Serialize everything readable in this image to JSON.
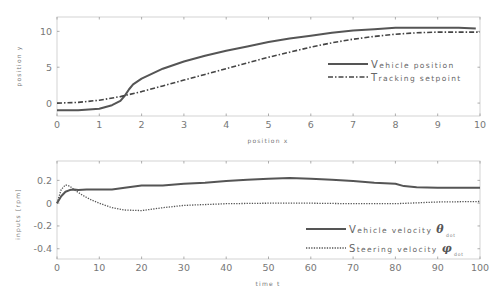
{
  "chart_data": [
    {
      "type": "line",
      "title": "",
      "xlabel": "position x",
      "ylabel": "position y",
      "xlim": [
        0,
        10
      ],
      "ylim": [
        -1.8,
        12
      ],
      "xticks": [
        0,
        1,
        2,
        3,
        4,
        5,
        6,
        7,
        8,
        9,
        10
      ],
      "yticks": [
        0,
        5,
        10
      ],
      "grid": false,
      "legend_position": "center right",
      "series": [
        {
          "name": "Vehicle position",
          "style": "solid",
          "color": "#555555",
          "x": [
            0,
            0.5,
            1.0,
            1.3,
            1.5,
            1.6,
            1.7,
            1.8,
            2.0,
            2.5,
            3.0,
            3.5,
            4.0,
            4.5,
            5.0,
            5.5,
            6.0,
            6.5,
            7.0,
            7.5,
            8.0,
            8.5,
            9.0,
            9.5,
            9.9
          ],
          "y": [
            -1.0,
            -1.0,
            -0.8,
            -0.3,
            0.3,
            1.0,
            1.9,
            2.6,
            3.4,
            4.8,
            5.8,
            6.6,
            7.3,
            7.9,
            8.5,
            9.0,
            9.4,
            9.8,
            10.1,
            10.3,
            10.5,
            10.5,
            10.5,
            10.5,
            10.4
          ]
        },
        {
          "name": "Tracking setpoint",
          "style": "dashdot",
          "color": "#444444",
          "x": [
            0,
            0.5,
            1.0,
            1.5,
            2.0,
            2.5,
            3.0,
            3.5,
            4.0,
            4.5,
            5.0,
            5.5,
            6.0,
            6.5,
            7.0,
            7.5,
            8.0,
            8.5,
            9.0,
            9.5,
            10.0
          ],
          "y": [
            0.0,
            0.1,
            0.4,
            0.9,
            1.6,
            2.4,
            3.2,
            4.0,
            4.8,
            5.6,
            6.4,
            7.1,
            7.8,
            8.4,
            8.9,
            9.3,
            9.6,
            9.8,
            9.9,
            9.9,
            9.9
          ]
        }
      ]
    },
    {
      "type": "line",
      "title": "",
      "xlabel": "time t",
      "ylabel": "inputs [rpm]",
      "xlim": [
        0,
        100
      ],
      "ylim": [
        -0.49,
        0.37
      ],
      "xticks": [
        0,
        10,
        20,
        30,
        40,
        50,
        60,
        70,
        80,
        90,
        100
      ],
      "yticks": [
        0.2,
        0,
        -0.2,
        -0.4
      ],
      "grid": false,
      "legend_position": "lower right",
      "series": [
        {
          "name": "Vehicle velocity θ_dot",
          "style": "solid",
          "color": "#555555",
          "x": [
            0,
            1,
            2,
            3,
            4,
            5,
            7,
            10,
            13,
            16,
            20,
            25,
            30,
            35,
            40,
            45,
            50,
            55,
            60,
            65,
            70,
            75,
            80,
            82,
            85,
            90,
            95,
            100
          ],
          "y": [
            0,
            0.06,
            0.1,
            0.115,
            0.12,
            0.115,
            0.12,
            0.12,
            0.12,
            0.135,
            0.155,
            0.155,
            0.17,
            0.18,
            0.195,
            0.205,
            0.215,
            0.22,
            0.215,
            0.205,
            0.195,
            0.18,
            0.17,
            0.15,
            0.14,
            0.135,
            0.135,
            0.135
          ]
        },
        {
          "name": "Steering velocity φ_dot",
          "style": "dotted",
          "color": "#555555",
          "x": [
            0,
            1,
            2,
            3,
            4,
            6,
            8,
            10,
            13,
            16,
            20,
            25,
            30,
            40,
            50,
            60,
            70,
            80,
            90,
            100
          ],
          "y": [
            0,
            0.12,
            0.16,
            0.15,
            0.12,
            0.07,
            0.03,
            0.0,
            -0.04,
            -0.06,
            -0.065,
            -0.04,
            -0.02,
            -0.005,
            0.0,
            0.0,
            -0.005,
            -0.005,
            0.01,
            0.015
          ]
        }
      ]
    }
  ],
  "top_plot": {
    "xlabel": "position x",
    "ylabel": "position y",
    "xtick_labels": [
      "0",
      "1",
      "2",
      "3",
      "4",
      "5",
      "6",
      "7",
      "8",
      "9",
      "10"
    ],
    "ytick_labels": [
      "0",
      "5",
      "10"
    ],
    "legend": {
      "item1_cap": "V",
      "item1_rest": "ehicle position",
      "item2_cap": "T",
      "item2_rest": "racking setpoint"
    }
  },
  "bottom_plot": {
    "xlabel": "time t",
    "ylabel": "inputs [rpm]",
    "xtick_labels": [
      "0",
      "10",
      "20",
      "30",
      "40",
      "50",
      "60",
      "70",
      "80",
      "90",
      "100"
    ],
    "ytick_labels": [
      "0.2",
      "0",
      "-0.2",
      "-0.4"
    ],
    "legend": {
      "item1_cap": "V",
      "item1_rest": "ehicle velocity",
      "item1_symbol": "θ",
      "item1_sub": "dot",
      "item2_cap": "S",
      "item2_rest": "teering velocity",
      "item2_symbol": "φ",
      "item2_sub": "dot"
    }
  }
}
